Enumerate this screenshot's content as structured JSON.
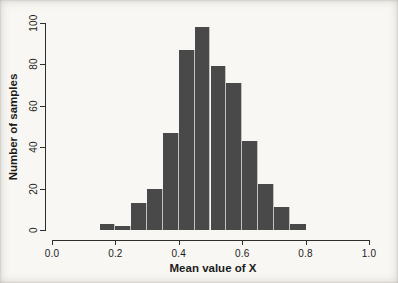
{
  "figure": {
    "background": "#f8f7f3",
    "bar_fill": "#494949",
    "bar_separator": "#c2c2c0",
    "axis_color": "#2e2e2e",
    "text_color": "#1c1c1c"
  },
  "chart_data": {
    "type": "bar",
    "subtype": "histogram",
    "title": "",
    "xlabel": "Mean value of X",
    "ylabel": "Number of samples",
    "bin_start": 0.15,
    "bin_width": 0.05,
    "bin_edges": [
      0.15,
      0.2,
      0.25,
      0.3,
      0.35,
      0.4,
      0.45,
      0.5,
      0.55,
      0.6,
      0.65,
      0.7,
      0.75,
      0.8
    ],
    "values": [
      3,
      2,
      13,
      20,
      47,
      87,
      98,
      79,
      71,
      43,
      22,
      11,
      3
    ],
    "total_samples": 499,
    "xlim": [
      0.0,
      1.0
    ],
    "ylim": [
      0,
      100
    ],
    "x_ticks": [
      0.0,
      0.2,
      0.4,
      0.6,
      0.8,
      1.0
    ],
    "x_tick_labels": [
      "0.0",
      "0.2",
      "0.4",
      "0.6",
      "0.8",
      "1.0"
    ],
    "y_ticks": [
      0,
      20,
      40,
      60,
      80,
      100
    ],
    "y_tick_labels": [
      "0",
      "20",
      "40",
      "60",
      "80",
      "100"
    ],
    "grid": false,
    "legend": null
  }
}
